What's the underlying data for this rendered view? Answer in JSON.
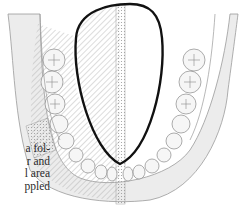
{
  "figure": {
    "outline_color": "#111111",
    "line_color": "#8a8a8a",
    "shade_color": "#e4e4e4"
  },
  "body_text": {
    "lines": [
      "a fol-",
      "r and",
      "l area",
      "ppled"
    ]
  }
}
